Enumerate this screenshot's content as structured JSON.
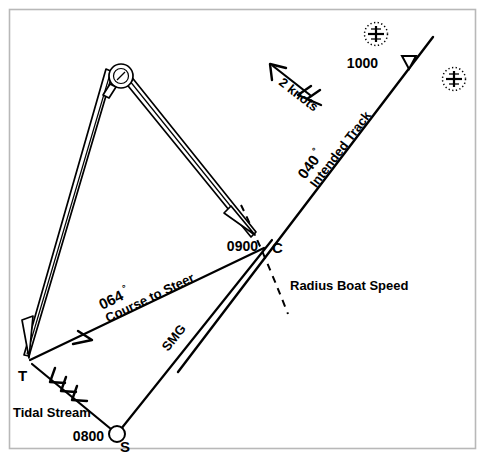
{
  "diagram": {
    "type": "navigation-plot",
    "background_color": "#ffffff",
    "ink_color": "#000000",
    "frame_color": "#b8b8b8"
  },
  "points": {
    "start": {
      "label": "S",
      "time_label": "0800",
      "description": "start-position-fix",
      "x": 117,
      "y": 434
    },
    "tide": {
      "label": "T",
      "description": "tidal-stream-vector-end",
      "x": 30,
      "y": 360
    },
    "course": {
      "label": "C",
      "time_label": "0900",
      "description": "course-to-steer-intersection-on-track",
      "x": 266,
      "y": 247
    },
    "track_hour2": {
      "time_label": "1000",
      "description": "second-hour-position-on-intended-track",
      "x": 396,
      "y": 62
    }
  },
  "vectors": {
    "intended_track": {
      "bearing": "040",
      "degree_symbol": "°",
      "name": "Intended Track"
    },
    "course_to_steer": {
      "bearing": "064",
      "degree_symbol": "°",
      "name": "Course to Steer"
    },
    "speed_made_good": {
      "name": "SMG"
    },
    "tidal_stream": {
      "name": "Tidal Stream",
      "rate": "2 knots"
    },
    "boat_speed_arc": {
      "name": "Radius Boat Speed"
    }
  },
  "symbols": {
    "rock_marks": [
      {
        "name": "rock-symbol-upper",
        "x": 376,
        "y": 34,
        "r": 12
      },
      {
        "name": "rock-symbol-lower",
        "x": 454,
        "y": 79,
        "r": 12
      }
    ],
    "dividers": {
      "name": "chart-dividers",
      "pivot_x": 121,
      "pivot_y": 76
    },
    "track_marker": {
      "name": "hour-marker-triangle"
    }
  }
}
